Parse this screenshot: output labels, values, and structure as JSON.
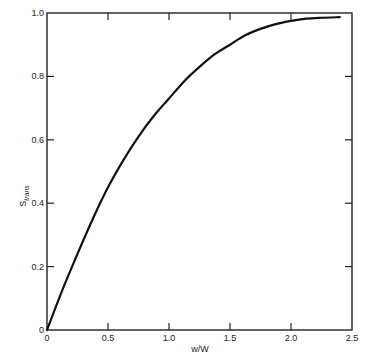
{
  "chart_data": {
    "type": "line",
    "title": "",
    "xlabel": "w/W",
    "ylabel": "S",
    "ylabel_subscript": "trans",
    "xlim": [
      0,
      2.5
    ],
    "ylim": [
      0,
      1.0
    ],
    "grid": false,
    "legend": null,
    "x_ticks": [
      0,
      0.5,
      1.0,
      1.5,
      2.0,
      2.5
    ],
    "x_tick_labels": [
      "0",
      "0.5",
      "1.0",
      "1.5",
      "2.0",
      "2.5"
    ],
    "y_ticks": [
      0,
      0.2,
      0.4,
      0.6,
      0.8,
      1.0
    ],
    "y_tick_labels": [
      "0",
      "0.2",
      "0.4",
      "0.6",
      "0.8",
      "1.0"
    ],
    "series": [
      {
        "name": "S_trans",
        "color": "#111111",
        "x": [
          0,
          0.125,
          0.25,
          0.375,
          0.5,
          0.625,
          0.75,
          0.875,
          1.0,
          1.125,
          1.25,
          1.375,
          1.5,
          1.625,
          1.75,
          1.875,
          2.0,
          2.125,
          2.25,
          2.4
        ],
        "values": [
          0,
          0.125,
          0.24,
          0.35,
          0.45,
          0.535,
          0.61,
          0.675,
          0.73,
          0.785,
          0.83,
          0.87,
          0.9,
          0.93,
          0.95,
          0.965,
          0.975,
          0.982,
          0.985,
          0.987
        ]
      }
    ]
  }
}
